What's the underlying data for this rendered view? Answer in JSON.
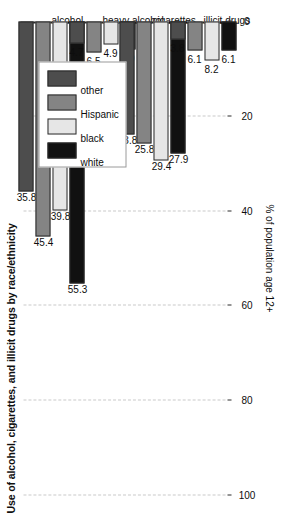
{
  "chart_data": {
    "type": "bar",
    "orientation": "horizontal",
    "title": "Use of alcohol, cigarettes, and illicit drugs by race/ethnicity",
    "xlabel": "% of population age 12+",
    "ylabel": "",
    "categories": [
      "alcohol",
      "heavy alcohol",
      "cigarettes",
      "illicit drugs"
    ],
    "series": [
      {
        "name": "white",
        "color": "#111111",
        "values": [
          55.3,
          6.0,
          27.9,
          6.1
        ]
      },
      {
        "name": "black",
        "color": "#e6e6e6",
        "values": [
          39.8,
          4.9,
          29.4,
          8.2
        ]
      },
      {
        "name": "Hispanic",
        "color": "#848484",
        "values": [
          45.4,
          6.5,
          25.8,
          6.1
        ]
      },
      {
        "name": "other",
        "color": "#4d4d4d",
        "values": [
          35.8,
          4.7,
          23.8,
          3.8
        ]
      }
    ],
    "ticks": [
      0,
      20,
      40,
      60,
      80,
      100
    ],
    "tick_labels": [
      "0",
      "20",
      "40",
      "60",
      "80",
      "100"
    ],
    "xlim": [
      0,
      100
    ],
    "grid": true,
    "grid_style": "dashed",
    "grid_color": "#c9c9c9",
    "legend_position": "top-left",
    "legend_entries": [
      "white",
      "black",
      "Hispanic",
      "other"
    ],
    "value_labels_shown": true
  },
  "axis": {
    "title": "% of population age 12+"
  }
}
